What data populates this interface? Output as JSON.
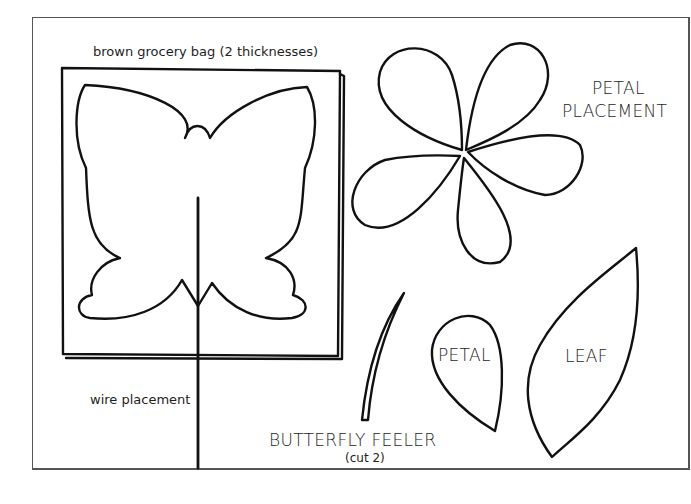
{
  "labels": {
    "bag": "brown grocery bag (2 thicknesses)",
    "wire": "wire placement",
    "petal_placement_line1": "PETAL",
    "petal_placement_line2": "PLACEMENT",
    "petal": "PETAL",
    "leaf": "LEAF",
    "feeler": "BUTTERFLY FEELER",
    "feeler_note": "(cut 2)"
  },
  "colors": {
    "line": "#111111",
    "frame": "#555555",
    "background": "#ffffff"
  }
}
